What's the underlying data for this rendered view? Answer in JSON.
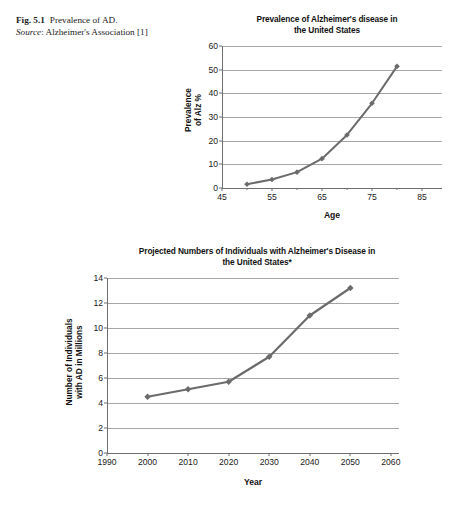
{
  "caption": {
    "fig_label": "Fig. 5.1",
    "fig_text": "Prevalence of AD.",
    "source_label": "Source",
    "source_text": ": Alzheimer's Association [1]"
  },
  "colors": {
    "series_line": "#6b6b6b",
    "gridline": "#a6a6a6",
    "axis": "#6f6f6f",
    "text": "#1a1a1a",
    "background": "#ffffff"
  },
  "chart_data": [
    {
      "id": "prevalence-chart",
      "type": "line",
      "title": "Prevalence of Alzheimer's disease in the United States",
      "title_line1": "Prevalence of Alzheimer's disease in",
      "title_line2": "the United States",
      "xlabel": "Age",
      "ylabel": "Prevalence of Alz %",
      "ylabel_line1": "Prevalence",
      "ylabel_line2": "of Alz %",
      "xlim": [
        45,
        89
      ],
      "ylim": [
        0,
        60
      ],
      "yticks": [
        0,
        10,
        20,
        30,
        40,
        50,
        60
      ],
      "xticks_major": [
        45,
        55,
        65,
        75,
        85
      ],
      "xticks_minor": [
        50,
        60,
        70,
        80
      ],
      "grid": true,
      "legend": "none",
      "x": [
        50,
        55,
        60,
        65,
        70,
        75,
        80
      ],
      "values": [
        1.6,
        3.6,
        6.7,
        12.4,
        22.4,
        35.8,
        51.4
      ]
    },
    {
      "id": "projection-chart",
      "type": "line",
      "title": "Projected Numbers of Individuals with Alzheimer's Disease in the United States*",
      "title_line1": "Projected Numbers of Individuals with Alzheimer's Disease in",
      "title_line2": "the United States*",
      "xlabel": "Year",
      "ylabel": "Number of Individuals with AD in Millions",
      "ylabel_line1": "Number of Individuals",
      "ylabel_line2": "with AD in Millions",
      "xlim": [
        1990,
        2062
      ],
      "ylim": [
        0,
        14
      ],
      "yticks": [
        0,
        2,
        4,
        6,
        8,
        10,
        12,
        14
      ],
      "xticks_major": [
        1990,
        2000,
        2010,
        2020,
        2030,
        2040,
        2050,
        2060
      ],
      "xticks_minor": [],
      "grid": true,
      "legend": "none",
      "x": [
        2000,
        2010,
        2020,
        2030,
        2040,
        2050
      ],
      "values": [
        4.5,
        5.1,
        5.7,
        7.7,
        11.0,
        13.2
      ]
    }
  ]
}
